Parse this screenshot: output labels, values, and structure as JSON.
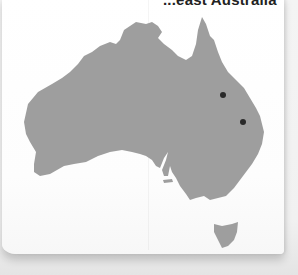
{
  "page": {
    "title_partial": "...east Australia"
  },
  "map": {
    "region": "Australia",
    "land_color": "#9e9e9e",
    "water_color": "#ffffff",
    "markers": [
      {
        "id": "marker-1",
        "x": 223,
        "y": 95,
        "color": "#2a2a2a"
      },
      {
        "id": "marker-2",
        "x": 243,
        "y": 122,
        "color": "#2a2a2a"
      }
    ]
  }
}
